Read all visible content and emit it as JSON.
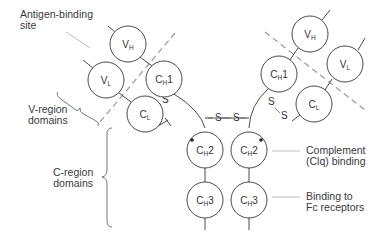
{
  "labels": {
    "antigen_binding_site": [
      "Antigen-binding",
      "site"
    ],
    "v_region": [
      "V-region",
      "domains"
    ],
    "c_region": [
      "C-region",
      "domains"
    ],
    "complement": [
      "Complement",
      "(Clq) binding"
    ],
    "fc_receptors": [
      "Binding to",
      "Fc receptors"
    ]
  },
  "domains": {
    "vh": {
      "main": "V",
      "sub": "H"
    },
    "vl": {
      "main": "V",
      "sub": "L"
    },
    "ch1": {
      "main": "C",
      "sub": "H",
      "suffix": "1"
    },
    "cl": {
      "main": "C",
      "sub": "L"
    },
    "ch2": {
      "main": "C",
      "sub": "H",
      "suffix": "2"
    },
    "ch3": {
      "main": "C",
      "sub": "H",
      "suffix": "3"
    }
  },
  "disulfide": "S",
  "colors": {
    "line": "#4a4a4a",
    "dashed": "#9a9a9a",
    "text": "#333333"
  }
}
